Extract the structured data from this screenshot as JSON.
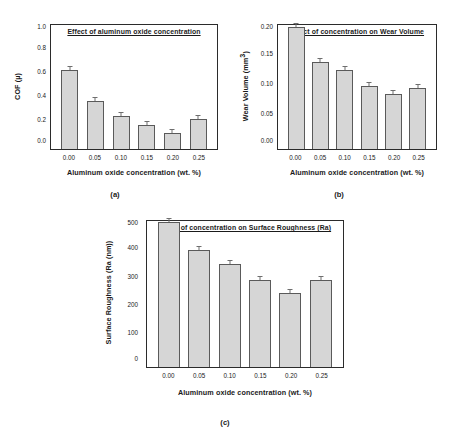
{
  "figure": {
    "background": "#ffffff",
    "bar_fill": "#d6d6d6",
    "bar_edge": "#5a5a5a",
    "axis_color": "#2b2b2b",
    "shared_xlabel": "Aluminum oxide concentration (wt. %)",
    "shared_categories": [
      "0.00",
      "0.05",
      "0.10",
      "0.15",
      "0.20",
      "0.25"
    ]
  },
  "panels": [
    {
      "letter": "(a)",
      "chart_data": {
        "type": "bar",
        "title": "Effect of aluminum oxide concentration",
        "xlabel": "Aluminum oxide concentration (wt. %)",
        "ylabel": "COF (µ)",
        "categories": [
          "0.00",
          "0.05",
          "0.10",
          "0.15",
          "0.20",
          "0.25"
        ],
        "values": [
          0.64,
          0.39,
          0.27,
          0.19,
          0.13,
          0.24
        ],
        "errors": [
          0.025,
          0.012,
          0.013,
          0.012,
          0.012,
          0.012
        ],
        "yticklabels": [
          "1.0",
          "0.8",
          "0.6",
          "0.4",
          "0.2",
          "0.0"
        ],
        "ylim": [
          0.0,
          1.0
        ],
        "grid": false,
        "legend": "none"
      }
    },
    {
      "letter": "(b)",
      "chart_data": {
        "type": "bar",
        "title": "Effect of concentration on Wear Volume",
        "xlabel": "Aluminum oxide concentration (wt. %)",
        "ylabel": "Wear Volume (mm³)",
        "categories": [
          "0.00",
          "0.05",
          "0.10",
          "0.15",
          "0.20",
          "0.25"
        ],
        "values": [
          0.196,
          0.14,
          0.127,
          0.101,
          0.088,
          0.098
        ],
        "errors": [
          0.004,
          0.002,
          0.002,
          0.002,
          0.002,
          0.002
        ],
        "yticklabels": [
          "0.20",
          "0.15",
          "0.10",
          "0.05",
          "0.00"
        ],
        "ylim": [
          0.0,
          0.2
        ],
        "grid": false,
        "legend": "none"
      }
    },
    {
      "letter": "(c)",
      "chart_data": {
        "type": "bar",
        "title": "Effect of concentration on Surface Roughness (Ra)",
        "xlabel": "Aluminum oxide concentration (wt. %)",
        "ylabel": "Surface Roughness (Ra (nm))",
        "categories": [
          "0.00",
          "0.05",
          "0.10",
          "0.15",
          "0.20",
          "0.25"
        ],
        "values": [
          497,
          400,
          352,
          298,
          252,
          298
        ],
        "errors": [
          5,
          5,
          4,
          5,
          5,
          4
        ],
        "yticklabels": [
          "500",
          "400",
          "300",
          "200",
          "100",
          "0"
        ],
        "ylim": [
          0,
          500
        ],
        "grid": false,
        "legend": "none"
      }
    }
  ]
}
